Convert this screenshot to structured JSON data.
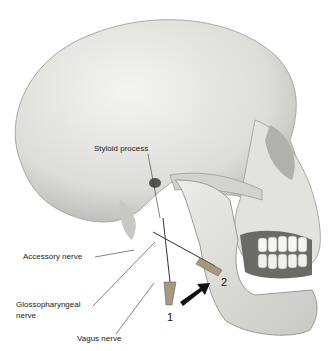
{
  "figure": {
    "labels": {
      "styloid": "Styloid process",
      "accessory": "Accessory nerve",
      "glosso_line1": "Glossopharyngeal",
      "glosso_line2": "nerve",
      "vagus": "Vagus nerve",
      "needle1": "1",
      "needle2": "2"
    }
  }
}
